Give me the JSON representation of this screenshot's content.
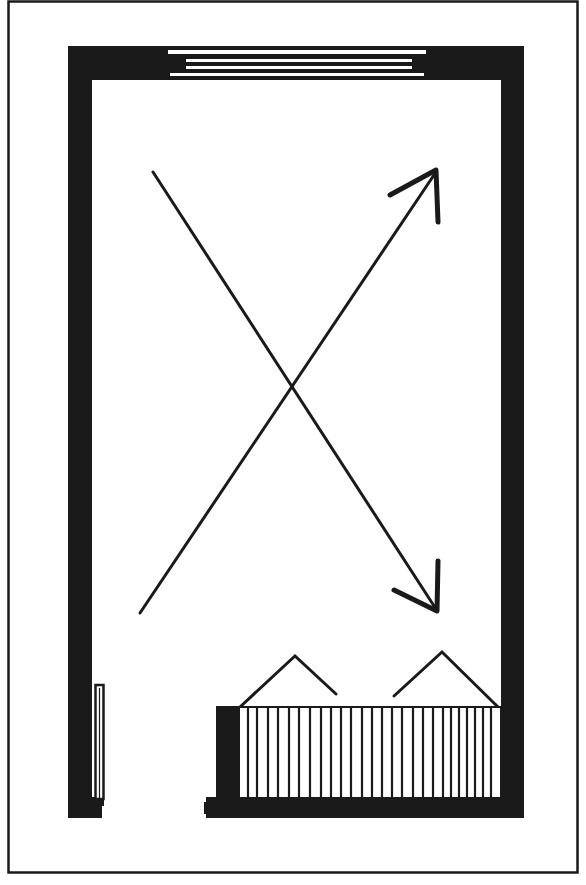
{
  "diagram": {
    "type": "floor-plan",
    "colors": {
      "ink": "#1a1a1a",
      "paper": "#ffffff"
    },
    "elements": {
      "frame": "outer-border",
      "walls": "thick-walls",
      "window": {
        "position": "top-wall",
        "panes": 4
      },
      "door": {
        "position": "lower-left-wall"
      },
      "arrows": [
        {
          "id": "arrow-up-right",
          "from": [
            140,
            613
          ],
          "to": [
            437,
            170
          ]
        },
        {
          "id": "arrow-down-right",
          "from": [
            153,
            172
          ],
          "to": [
            437,
            610
          ]
        }
      ],
      "radiator": {
        "position": "bottom-wall",
        "fins": 26
      },
      "chairs": [
        {
          "id": "chair-left",
          "apex": [
            295,
            656
          ]
        },
        {
          "id": "chair-right",
          "apex": [
            442,
            652
          ]
        }
      ]
    }
  }
}
